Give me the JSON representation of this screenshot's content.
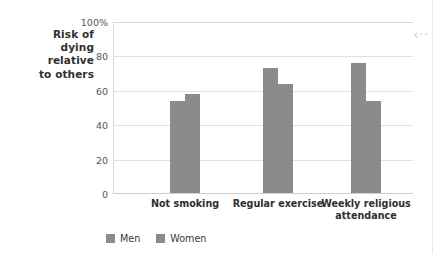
{
  "chart_data": {
    "type": "bar",
    "title": "",
    "xlabel": "",
    "ylabel": "Risk of\ndying\nrelative\nto others",
    "ylabel_lines": [
      "Risk of",
      "dying",
      "relative",
      "to others"
    ],
    "categories": [
      "Not smoking",
      "Regular exercise",
      "Weekly religious attendance"
    ],
    "category_lines": [
      [
        "Not smoking"
      ],
      [
        "Regular exercise"
      ],
      [
        "Weekly religious",
        "attendance"
      ]
    ],
    "series": [
      {
        "name": "Men",
        "values": [
          54,
          73,
          76
        ]
      },
      {
        "name": "Women",
        "values": [
          58,
          64,
          54
        ]
      }
    ],
    "ylim": [
      0,
      100
    ],
    "yticks": [
      0,
      20,
      40,
      60,
      80,
      100
    ],
    "ytick_labels": [
      "0",
      "20",
      "40",
      "60",
      "80",
      "100%"
    ],
    "grid": true,
    "legend_position": "bottom-left",
    "bar_color": "#8b8b8b",
    "grid_color": "#e0e0e0",
    "axis_color": "#d6d6d6",
    "text_color": "#2f2f2f"
  },
  "annotation": {
    "arrow_marker": "‹··"
  }
}
